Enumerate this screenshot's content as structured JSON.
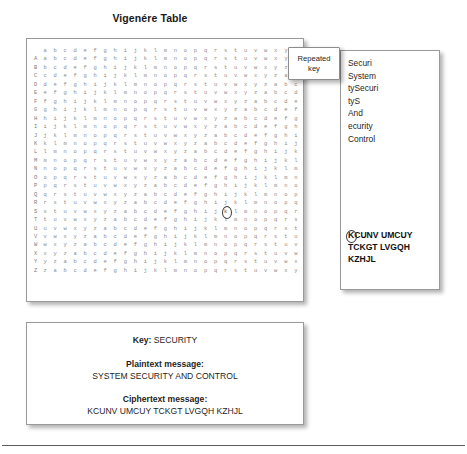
{
  "figure": {
    "title": "Vigenére Table"
  },
  "vigenere_table": {
    "header": [
      "a",
      "b",
      "c",
      "d",
      "e",
      "f",
      "g",
      "h",
      "i",
      "j",
      "k",
      "l",
      "m",
      "n",
      "o",
      "p",
      "q",
      "r",
      "s",
      "t",
      "u",
      "v",
      "w",
      "x",
      "y",
      "z"
    ],
    "row_labels": [
      "A",
      "B",
      "C",
      "D",
      "E",
      "F",
      "G",
      "H",
      "I",
      "J",
      "K",
      "L",
      "M",
      "N",
      "O",
      "P",
      "Q",
      "R",
      "S",
      "T",
      "U",
      "V",
      "W",
      "X",
      "Y",
      "Z"
    ],
    "rows": [
      "abcdefghijklmnopqrstuvwxyz",
      "bcdefghijklmnopqrstuvwxyza",
      "cdefghijklmnopqrstuvwxyzab",
      "defghijklmnopqrstuvwxyzabc",
      "efghijklmnopqrstuvwxyzabcd",
      "fghijklmnopqrstuvwxyzabcde",
      "ghijklmnopqrstuvwxyzabcdef",
      "hijklmnopqrstuvwxyzabcdefg",
      "ijklmnopqrstuvwxyzabcdefgh",
      "jklmnopqrstuvwxyzabcdefghi",
      "klmnopqrstuvwxyzabcdefghij",
      "lmnopqrstuvwxyzabcdefghijk",
      "mnopqrstuvwxyzabcdefghijkl",
      "nopqrstuvwxyzabcdefghijklm",
      "opqrstuvwxyzabcdefghijklmn",
      "pqrstuvwxyzabcdefghijklmno",
      "qrstuvwxyzabcdefghijklmnop",
      "rstuvwxyzabcdefghijklmnopq",
      "stuvwxyzabcdefghijklmnopqr",
      "tuvwxyzabcdefghijklmnopqrs",
      "uvwxyzabcdefghijklmnopqrst",
      "vwxyzabcdefghijklmnopqrstu",
      "wxyzabcdefghijklmnopqrstuv",
      "xyzabcdefghijklmnopqrstuvw",
      "yzabcdefghijklmnopqrstuvwx",
      "zabcdefghijklmnopqrstuvwxy"
    ],
    "highlighted_cell": {
      "row": "S",
      "column": "s",
      "letter": "k"
    }
  },
  "callout": {
    "repeated_key_label": "Repeated\nkey"
  },
  "key_panel": {
    "fragments": [
      "Securi",
      "System",
      "tySecuri",
      "tyS",
      "And",
      "ecurity",
      "Control"
    ],
    "ciphertext_lines": [
      "KCUNV UMCUY",
      "TCKGT LVGQH",
      "KZHJL"
    ]
  },
  "summary": {
    "key_label": "Key:",
    "key_value": "SECURITY",
    "plaintext_label": "Plaintext message:",
    "plaintext_value": "SYSTEM SECURITY AND CONTROL",
    "ciphertext_label": "Ciphertext message:",
    "ciphertext_value": "KCUNV UMCUY TCKGT LVGQH KZHJL"
  },
  "colors": {
    "panel_border": "#9a9a9a",
    "table_text": "#8d8d8d",
    "body_text": "#1f1f1f",
    "rule": "#5d5d66"
  }
}
